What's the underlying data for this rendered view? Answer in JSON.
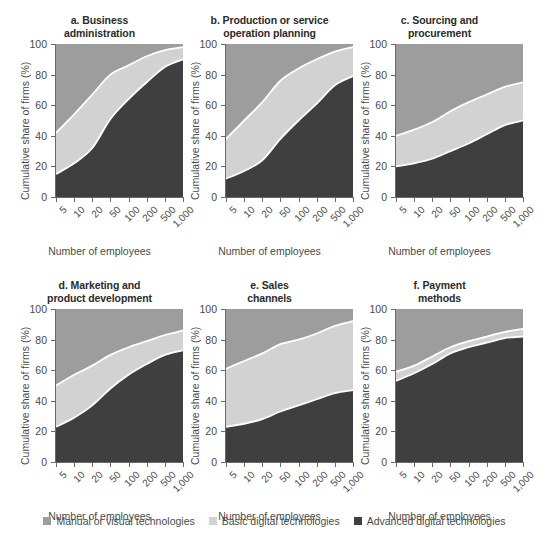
{
  "figure": {
    "xlabel": "Number of employees",
    "ylabel": "Cumulative share of firms (%)",
    "yticks": [
      "0",
      "20",
      "40",
      "60",
      "80",
      "100"
    ],
    "xticks": [
      "5",
      "10",
      "20",
      "50",
      "100",
      "200",
      "500",
      "1,000"
    ]
  },
  "legend": {
    "items": [
      {
        "label": "Manual or visual technologies",
        "color": "#9d9d9d"
      },
      {
        "label": "Basic digital technologies",
        "color": "#d2d2d2"
      },
      {
        "label": "Advanced digital technologies",
        "color": "#3f3f3f"
      }
    ]
  },
  "colors": {
    "manual": "#9d9d9d",
    "basic": "#d2d2d2",
    "advanced": "#3f3f3f",
    "separator": "#ffffff",
    "axis": "#6a6a6a",
    "text": "#4a4a4a",
    "title": "#2b2b2b"
  },
  "chart_data": [
    {
      "type": "area",
      "id": "a",
      "title": "a. Business administration",
      "title_lines": [
        "a. Business",
        "administration"
      ],
      "xlabel": "Number of employees",
      "ylabel": "Cumulative share of firms (%)",
      "x": [
        5,
        10,
        20,
        50,
        100,
        200,
        500,
        1000
      ],
      "xtick_labels": [
        "5",
        "10",
        "20",
        "50",
        "100",
        "200",
        "500",
        "1,000"
      ],
      "ylim": [
        0,
        100
      ],
      "yticks": [
        0,
        20,
        40,
        60,
        80,
        100
      ],
      "grid": false,
      "legend_position": "bottom",
      "stacked": true,
      "series": [
        {
          "name": "Advanced digital technologies",
          "cumulative": [
            15,
            22,
            32,
            51,
            64,
            75,
            85,
            90
          ]
        },
        {
          "name": "Basic digital technologies",
          "cumulative": [
            42,
            54,
            67,
            80,
            86,
            92,
            96,
            98
          ]
        },
        {
          "name": "Manual or visual technologies",
          "cumulative": [
            100,
            100,
            100,
            100,
            100,
            100,
            100,
            100
          ]
        }
      ]
    },
    {
      "type": "area",
      "id": "b",
      "title": "b. Production or service operation planning",
      "title_lines": [
        "b. Production or service",
        "operation planning"
      ],
      "xlabel": "Number of employees",
      "ylabel": "Cumulative share of firms (%)",
      "x": [
        5,
        10,
        20,
        50,
        100,
        200,
        500,
        1000
      ],
      "xtick_labels": [
        "5",
        "10",
        "20",
        "50",
        "100",
        "200",
        "500",
        "1,000"
      ],
      "ylim": [
        0,
        100
      ],
      "yticks": [
        0,
        20,
        40,
        60,
        80,
        100
      ],
      "grid": false,
      "legend_position": "bottom",
      "stacked": true,
      "series": [
        {
          "name": "Advanced digital technologies",
          "cumulative": [
            12,
            17,
            24,
            38,
            50,
            61,
            73,
            79
          ]
        },
        {
          "name": "Basic digital technologies",
          "cumulative": [
            38,
            50,
            62,
            76,
            84,
            90,
            95,
            98
          ]
        },
        {
          "name": "Manual or visual technologies",
          "cumulative": [
            100,
            100,
            100,
            100,
            100,
            100,
            100,
            100
          ]
        }
      ]
    },
    {
      "type": "area",
      "id": "c",
      "title": "c. Sourcing and procurement",
      "title_lines": [
        "c. Sourcing and",
        "procurement"
      ],
      "xlabel": "Number of employees",
      "ylabel": "Cumulative share of firms (%)",
      "x": [
        5,
        10,
        20,
        50,
        100,
        200,
        500,
        1000
      ],
      "xtick_labels": [
        "5",
        "10",
        "20",
        "50",
        "100",
        "200",
        "500",
        "1,000"
      ],
      "ylim": [
        0,
        100
      ],
      "yticks": [
        0,
        20,
        40,
        60,
        80,
        100
      ],
      "grid": false,
      "legend_position": "bottom",
      "stacked": true,
      "series": [
        {
          "name": "Advanced digital technologies",
          "cumulative": [
            20,
            22,
            25,
            30,
            35,
            41,
            47,
            50
          ]
        },
        {
          "name": "Basic digital technologies",
          "cumulative": [
            40,
            44,
            49,
            56,
            62,
            67,
            72,
            75
          ]
        },
        {
          "name": "Manual or visual technologies",
          "cumulative": [
            100,
            100,
            100,
            100,
            100,
            100,
            100,
            100
          ]
        }
      ]
    },
    {
      "type": "area",
      "id": "d",
      "title": "d. Marketing and product development",
      "title_lines": [
        "d. Marketing and",
        "product development"
      ],
      "xlabel": "Number of employees",
      "ylabel": "Cumulative share of firms (%)",
      "x": [
        5,
        10,
        20,
        50,
        100,
        200,
        500,
        1000
      ],
      "xtick_labels": [
        "5",
        "10",
        "20",
        "50",
        "100",
        "200",
        "500",
        "1,000"
      ],
      "ylim": [
        0,
        100
      ],
      "yticks": [
        0,
        20,
        40,
        60,
        80,
        100
      ],
      "grid": false,
      "legend_position": "bottom",
      "stacked": true,
      "series": [
        {
          "name": "Advanced digital technologies",
          "cumulative": [
            23,
            29,
            37,
            48,
            57,
            64,
            70,
            73
          ]
        },
        {
          "name": "Basic digital technologies",
          "cumulative": [
            50,
            57,
            63,
            70,
            75,
            79,
            83,
            86
          ]
        },
        {
          "name": "Manual or visual technologies",
          "cumulative": [
            100,
            100,
            100,
            100,
            100,
            100,
            100,
            100
          ]
        }
      ]
    },
    {
      "type": "area",
      "id": "e",
      "title": "e. Sales channels",
      "title_lines": [
        "e. Sales",
        "channels"
      ],
      "xlabel": "Number of employees",
      "ylabel": "Cumulative share of firms (%)",
      "x": [
        5,
        10,
        20,
        50,
        100,
        200,
        500,
        1000
      ],
      "xtick_labels": [
        "5",
        "10",
        "20",
        "50",
        "100",
        "200",
        "500",
        "1,000"
      ],
      "ylim": [
        0,
        100
      ],
      "yticks": [
        0,
        20,
        40,
        60,
        80,
        100
      ],
      "grid": false,
      "legend_position": "bottom",
      "stacked": true,
      "series": [
        {
          "name": "Advanced digital technologies",
          "cumulative": [
            23,
            25,
            28,
            33,
            37,
            41,
            45,
            47
          ]
        },
        {
          "name": "Basic digital technologies",
          "cumulative": [
            61,
            66,
            71,
            77,
            80,
            84,
            89,
            92
          ]
        },
        {
          "name": "Manual or visual technologies",
          "cumulative": [
            100,
            100,
            100,
            100,
            100,
            100,
            100,
            100
          ]
        }
      ]
    },
    {
      "type": "area",
      "id": "f",
      "title": "f. Payment methods",
      "title_lines": [
        "f. Payment",
        "methods"
      ],
      "xlabel": "Number of employees",
      "ylabel": "Cumulative share of firms (%)",
      "x": [
        5,
        10,
        20,
        50,
        100,
        200,
        500,
        1000
      ],
      "xtick_labels": [
        "5",
        "10",
        "20",
        "50",
        "100",
        "200",
        "500",
        "1,000"
      ],
      "ylim": [
        0,
        100
      ],
      "yticks": [
        0,
        20,
        40,
        60,
        80,
        100
      ],
      "grid": false,
      "legend_position": "bottom",
      "stacked": true,
      "series": [
        {
          "name": "Advanced digital technologies",
          "cumulative": [
            53,
            58,
            64,
            71,
            75,
            78,
            81,
            82
          ]
        },
        {
          "name": "Basic digital technologies",
          "cumulative": [
            59,
            63,
            69,
            75,
            79,
            82,
            85,
            87
          ]
        },
        {
          "name": "Manual or visual technologies",
          "cumulative": [
            100,
            100,
            100,
            100,
            100,
            100,
            100,
            100
          ]
        }
      ]
    }
  ]
}
